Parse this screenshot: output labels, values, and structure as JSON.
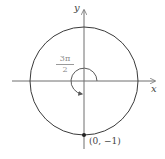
{
  "diagram": {
    "type": "unit-circle-angle",
    "axes": {
      "x_label": "x",
      "y_label": "y"
    },
    "angle": {
      "numerator": "3π",
      "denominator": "2",
      "direction": "counterclockwise"
    },
    "point": {
      "label": "(0, −1)",
      "coords": [
        0,
        -1
      ]
    },
    "colors": {
      "circle": "#3a3a3a",
      "axis": "#6e6e6e",
      "angle_label": "#8a8a8a",
      "point": "#222222"
    }
  }
}
